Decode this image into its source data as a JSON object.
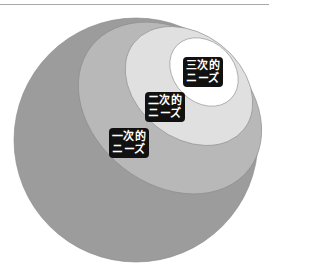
{
  "diagram": {
    "type": "nested-ellipses",
    "layers": [
      {
        "level": 1,
        "name": "一次的ニーズ",
        "line1": "一次的",
        "line2": "ニーズ",
        "color": "#9c9c9c"
      },
      {
        "level": 2,
        "name": "二次的ニーズ",
        "line1": "二次的",
        "line2": "ニーズ",
        "color": "#b8b8b8"
      },
      {
        "level": 3,
        "name": "三次的ニーズ",
        "line1": "三次的",
        "line2": "ニーズ",
        "color": "#e0e0e0"
      },
      {
        "level": 4,
        "name": "core",
        "color": "#ffffff"
      }
    ],
    "label_bg": "#111111",
    "label_fg": "#ffffff",
    "rule_color": "#a8a8a8"
  }
}
